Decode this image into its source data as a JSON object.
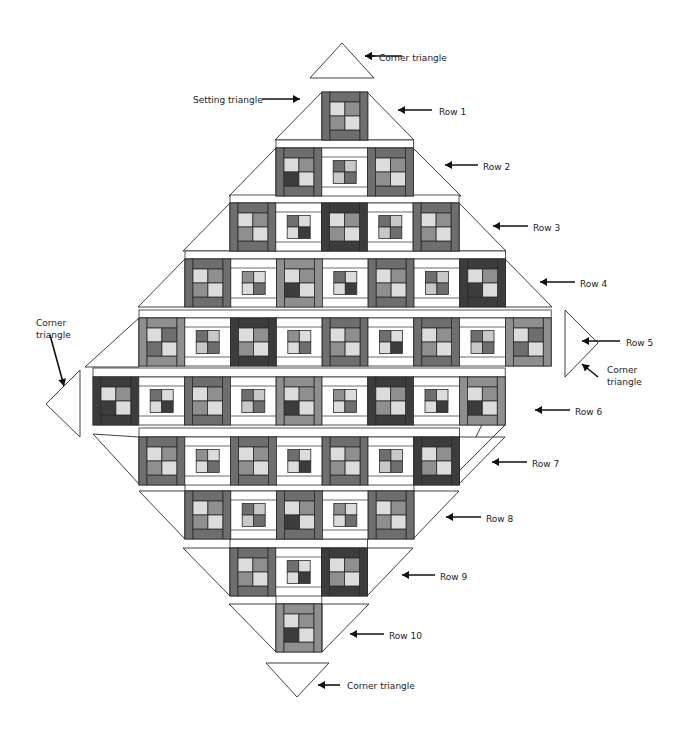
{
  "diagram": {
    "title": "",
    "type": "on-point quilt layout",
    "colors": {
      "outline": "#2b2b2b",
      "background": "#ffffff",
      "sashing": "#ffffff",
      "dark": "#3c3c3c",
      "medium": "#6e6e6e",
      "medium_light": "#8f8f8f",
      "light": "#c8c8c8",
      "pale": "#dcdcdc",
      "gray": "#a3a3a3"
    },
    "block_types_legend": {
      "D": "dark framed block (dark side bars)",
      "M": "medium framed block (medium side bars)",
      "L": "light-medium framed block (lighter side bars)",
      "W": "white framed block (white sashing around small four-patch)"
    },
    "rows": [
      {
        "label": "Row 1",
        "blocks": [
          "M"
        ]
      },
      {
        "label": "Row 2",
        "blocks": [
          "M",
          "W",
          "M"
        ]
      },
      {
        "label": "Row 3",
        "blocks": [
          "M",
          "W",
          "D",
          "W",
          "M"
        ]
      },
      {
        "label": "Row 4",
        "blocks": [
          "M",
          "W",
          "L",
          "W",
          "M",
          "W",
          "D"
        ]
      },
      {
        "label": "Row 5",
        "blocks": [
          "L",
          "W",
          "D",
          "W",
          "M",
          "W",
          "M",
          "W",
          "L"
        ]
      },
      {
        "label": "Row 6",
        "blocks": [
          "D",
          "W",
          "M",
          "W",
          "L",
          "W",
          "D",
          "W",
          "L"
        ]
      },
      {
        "label": "Row 7",
        "blocks": [
          "M",
          "W",
          "M",
          "W",
          "M",
          "W",
          "D"
        ]
      },
      {
        "label": "Row 8",
        "blocks": [
          "M",
          "W",
          "M",
          "W",
          "M"
        ]
      },
      {
        "label": "Row 9",
        "blocks": [
          "M",
          "W",
          "D"
        ]
      },
      {
        "label": "Row 10",
        "blocks": [
          "L"
        ]
      }
    ],
    "annotations": {
      "corner_top": "Corner triangle",
      "setting_triangle": "Setting triangle",
      "corner_left": "Corner\ntriangle",
      "corner_right": "Corner\ntriangle",
      "corner_bottom": "Corner triangle",
      "row_labels": [
        "Row 1",
        "Row 2",
        "Row 3",
        "Row 4",
        "Row 5",
        "Row 6",
        "Row 7",
        "Row 8",
        "Row 9",
        "Row 10"
      ]
    }
  }
}
